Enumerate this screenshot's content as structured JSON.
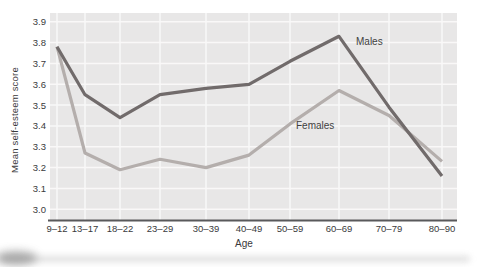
{
  "chart_data": {
    "type": "line",
    "title": "",
    "ylabel": "Mean self-esteem score",
    "xlabel": "Age",
    "ylim": [
      3.0,
      3.9
    ],
    "ytick_labels": [
      "3.9",
      "3.8",
      "3.7",
      "3.6",
      "3.5",
      "3.4",
      "3.3",
      "3.2",
      "3.1",
      "3.0"
    ],
    "categories": [
      "9–12",
      "13–17",
      "18–22",
      "23–29",
      "30–39",
      "40–49",
      "50–59",
      "60–69",
      "70–79",
      "80–90"
    ],
    "series": [
      {
        "name": "Males",
        "values": [
          3.78,
          3.55,
          3.44,
          3.55,
          3.58,
          3.6,
          3.71,
          3.83,
          3.49,
          3.16
        ],
        "color": "#716b6b"
      },
      {
        "name": "Females",
        "values": [
          3.78,
          3.27,
          3.19,
          3.24,
          3.2,
          3.26,
          3.41,
          3.57,
          3.45,
          3.23
        ],
        "color": "#b4aeac"
      }
    ],
    "grid": true,
    "legend_position": "inline-labels-on-plot",
    "plot_bg": "#e8e7e7",
    "grid_color": "#f9f8f8",
    "axis_color": "#59595b",
    "text_color": "#3a3a3c",
    "x_positions_px": [
      57,
      85,
      120,
      160,
      206,
      249,
      290,
      339,
      389,
      442
    ]
  }
}
